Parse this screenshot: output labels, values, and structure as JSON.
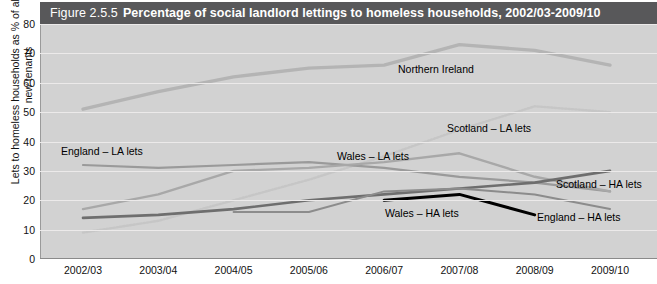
{
  "figure": {
    "number": "Figure 2.5.5",
    "title": "Percentage of social landlord lettings to homeless households, 2002/03-2009/10"
  },
  "axes": {
    "ylabel": "Lets to homeless households as % of all lets to new tenants",
    "yticks": [
      "0",
      "10",
      "20",
      "30",
      "40",
      "50",
      "60",
      "70",
      "80"
    ],
    "xticks": [
      "2002/03",
      "2003/04",
      "2004/05",
      "2005/06",
      "2006/07",
      "2007/08",
      "2008/09",
      "2009/10"
    ]
  },
  "series_labels": {
    "northern_ireland": "Northern Ireland",
    "scotland_la": "Scotland – LA lets",
    "england_la": "England – LA lets",
    "wales_la": "Wales – LA lets",
    "scotland_ha": "Scotland – HA lets",
    "england_ha": "England – HA lets",
    "wales_ha": "Wales – HA lets"
  },
  "colors": {
    "title_bar": "#58585a",
    "plot_background": "#d2d2d2",
    "gridline": "#eceaea",
    "northern_ireland": "#b4b4b4",
    "scotland_la": "#c6c6c6",
    "england_la": "#9a9a9a",
    "wales_la": "#a8a8a8",
    "scotland_ha": "#6e6e6e",
    "england_ha": "#8c8c8c",
    "wales_ha": "#000000"
  },
  "chart_data": {
    "type": "line",
    "title": "Percentage of social landlord lettings to homeless households, 2002/03-2009/10",
    "xlabel": "",
    "ylabel": "Lets to homeless households as % of all lets to new tenants",
    "categories": [
      "2002/03",
      "2003/04",
      "2004/05",
      "2005/06",
      "2006/07",
      "2007/08",
      "2008/09",
      "2009/10"
    ],
    "ylim": [
      0,
      80
    ],
    "ytick_step": 10,
    "grid": true,
    "legend": "inline-labels",
    "series": [
      {
        "name": "Northern Ireland",
        "style": "solid-thick",
        "color": "#b4b4b4",
        "values": [
          51,
          57,
          62,
          65,
          66,
          73,
          71,
          66
        ]
      },
      {
        "name": "Scotland – LA lets",
        "style": "dotted",
        "color": "#c6c6c6",
        "values": [
          9,
          13,
          20,
          27,
          35,
          44,
          52,
          50
        ]
      },
      {
        "name": "England – LA lets",
        "style": "solid",
        "color": "#9a9a9a",
        "values": [
          32,
          31,
          32,
          33,
          31,
          28,
          26,
          23
        ]
      },
      {
        "name": "Wales – LA lets",
        "style": "solid",
        "color": "#a8a8a8",
        "values": [
          17,
          22,
          30,
          31,
          33,
          36,
          28,
          23
        ]
      },
      {
        "name": "Scotland – HA lets",
        "style": "solid",
        "color": "#6e6e6e",
        "values": [
          14,
          15,
          17,
          20,
          22,
          24,
          26,
          30
        ]
      },
      {
        "name": "England – HA lets",
        "style": "solid",
        "color": "#8c8c8c",
        "values": [
          null,
          null,
          16,
          16,
          23,
          24,
          22,
          17
        ]
      },
      {
        "name": "Wales – HA lets",
        "style": "solid-thick",
        "color": "#000000",
        "values": [
          null,
          null,
          null,
          null,
          20,
          22,
          15,
          null
        ]
      }
    ]
  }
}
